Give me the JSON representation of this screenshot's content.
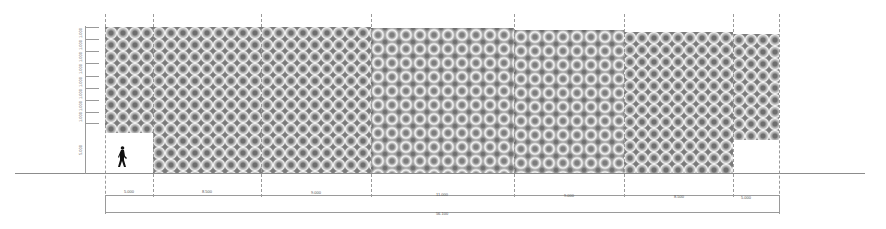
{
  "drawing": {
    "type": "facade-elevation",
    "pattern_description": "gray op-art interlocking circle / wave pattern",
    "colors": {
      "pattern_dark": "#6e6e6e",
      "pattern_mid": "#a9a9a9",
      "pattern_light": "#f2f2f2",
      "lines": "#9a9a9a",
      "figure": "#111111"
    }
  },
  "horizontal_dimensions": {
    "segments": [
      {
        "label": "5.000"
      },
      {
        "label": "8.500"
      },
      {
        "label": "9.000"
      },
      {
        "label": "11.000"
      },
      {
        "label": "9.000"
      },
      {
        "label": "8.500"
      },
      {
        "label": "5.000"
      }
    ],
    "total": {
      "label": "56.100"
    }
  },
  "vertical_dimensions": {
    "labels": [
      "1.000",
      "1.000",
      "1.000",
      "1.000",
      "1.000",
      "1.000",
      "1.000",
      "1.000",
      "5.000"
    ]
  },
  "figures": [
    {
      "name": "walking-person",
      "description": "silhouette of pedestrian for scale"
    }
  ]
}
